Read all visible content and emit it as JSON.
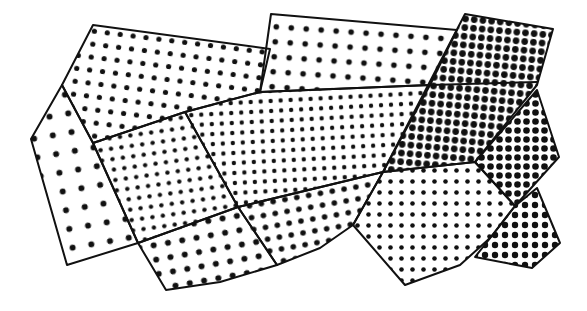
{
  "figure": {
    "width": 587,
    "height": 311,
    "background": "#ffffff",
    "ink_color": "#111111",
    "outline_width": 2,
    "regions": [
      {
        "id": "upper-left-quad",
        "points": "93,25 270,49 260,92 185,112 93,143 62,85",
        "dot_spacing": 13,
        "dot_radius": 2.6,
        "angle": 7
      },
      {
        "id": "left-pentagon",
        "points": "62,85 93,143 138,243 67,265 31,139",
        "dot_spacing": 19,
        "dot_radius": 3.0,
        "angle": -10
      },
      {
        "id": "top-middle-rect",
        "points": "271,14 457,30 430,85 260,92",
        "dot_spacing": 15,
        "dot_radius": 2.8,
        "angle": 4
      },
      {
        "id": "band-left",
        "points": "93,143 185,112 238,207 138,243",
        "dot_spacing": 10.5,
        "dot_radius": 2.2,
        "angle": -8
      },
      {
        "id": "band-middle",
        "points": "185,112 260,92 430,85 383,172 238,207",
        "dot_spacing": 10,
        "dot_radius": 2.2,
        "angle": -3
      },
      {
        "id": "lower-left-quad",
        "points": "138,243 238,207 277,265 220,282 166,290",
        "dot_spacing": 14.5,
        "dot_radius": 3.0,
        "angle": -10
      },
      {
        "id": "lower-middle-quad",
        "points": "238,207 383,172 353,225 320,248 277,265",
        "dot_spacing": 12,
        "dot_radius": 2.8,
        "angle": -10
      },
      {
        "id": "dark-top-right-quad",
        "points": "465,14 553,29 537,85 475,162 383,172",
        "dot_spacing": 8.7,
        "dot_radius": 3.3,
        "angle": 5
      },
      {
        "id": "right-diamond",
        "points": "475,162 537,90 559,157 515,206",
        "dot_spacing": 9,
        "dot_radius": 3.3,
        "angle": 0
      },
      {
        "id": "lower-right-pentagon",
        "points": "383,172 475,162 515,206 490,238 460,265 405,285 353,225",
        "dot_spacing": 11,
        "dot_radius": 2.3,
        "angle": 0
      },
      {
        "id": "lower-right-quad",
        "points": "515,206 537,188 560,243 532,268 475,257 495,232",
        "dot_spacing": 10,
        "dot_radius": 3.2,
        "angle": 0
      }
    ],
    "lines": [
      {
        "id": "dark-quad-divider",
        "points": "430,85 537,82"
      }
    ]
  }
}
